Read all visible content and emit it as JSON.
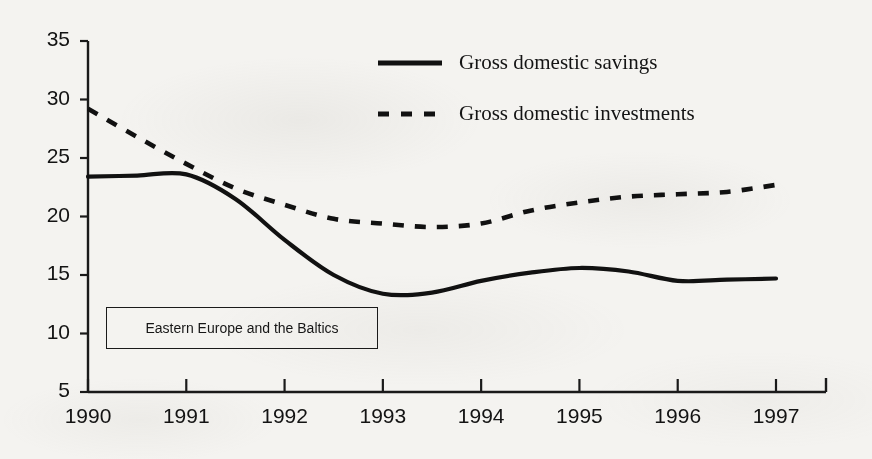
{
  "chart_data": {
    "type": "line",
    "title": "",
    "subtitle": "",
    "xlabel": "",
    "ylabel": "",
    "annotation": "Eastern Europe and the Baltics",
    "grid": false,
    "legend_position": "top-right",
    "x": [
      "1990",
      "1991",
      "1992",
      "1993",
      "1994",
      "1995",
      "1996",
      "1997"
    ],
    "xlim": [
      1990,
      1997
    ],
    "ylim": [
      5,
      35
    ],
    "yticks": [
      "35",
      "30",
      "25",
      "20",
      "15",
      "10",
      "5"
    ],
    "ytick_values": [
      35,
      30,
      25,
      20,
      15,
      10,
      5
    ],
    "xticks": [
      "1990",
      "1991",
      "1992",
      "1993",
      "1994",
      "1995",
      "1996",
      "1997"
    ],
    "series": [
      {
        "name": "Gross domestic savings",
        "style": "solid",
        "color": "#111111",
        "x": [
          1990,
          1990.5,
          1991,
          1991.5,
          1992,
          1992.5,
          1993,
          1993.5,
          1994,
          1994.5,
          1995,
          1995.5,
          1996,
          1996.5,
          1997
        ],
        "values": [
          23.4,
          23.5,
          23.6,
          21.5,
          18.0,
          15.0,
          13.4,
          13.5,
          14.5,
          15.2,
          15.6,
          15.3,
          14.5,
          14.6,
          14.7
        ]
      },
      {
        "name": "Gross domestic investments",
        "style": "dashed",
        "color": "#111111",
        "x": [
          1990,
          1990.5,
          1991,
          1991.5,
          1992,
          1992.5,
          1993,
          1993.5,
          1994,
          1994.5,
          1995,
          1995.5,
          1996,
          1996.5,
          1997
        ],
        "values": [
          29.2,
          26.8,
          24.5,
          22.4,
          21.0,
          19.8,
          19.4,
          19.1,
          19.4,
          20.5,
          21.2,
          21.7,
          21.9,
          22.1,
          22.7
        ]
      }
    ]
  },
  "legend": {
    "items": [
      {
        "label": "Gross domestic savings",
        "style": "solid"
      },
      {
        "label": "Gross domestic investments",
        "style": "dashed"
      }
    ]
  },
  "axes": {
    "y_labels": [
      "35",
      "30",
      "25",
      "20",
      "15",
      "10",
      "5"
    ],
    "x_labels": [
      "1990",
      "1991",
      "1992",
      "1993",
      "1994",
      "1995",
      "1996",
      "1997"
    ]
  },
  "annotation": {
    "text": "Eastern Europe and the Baltics"
  },
  "colors": {
    "ink": "#111111",
    "paper": "#f4f3f0"
  }
}
